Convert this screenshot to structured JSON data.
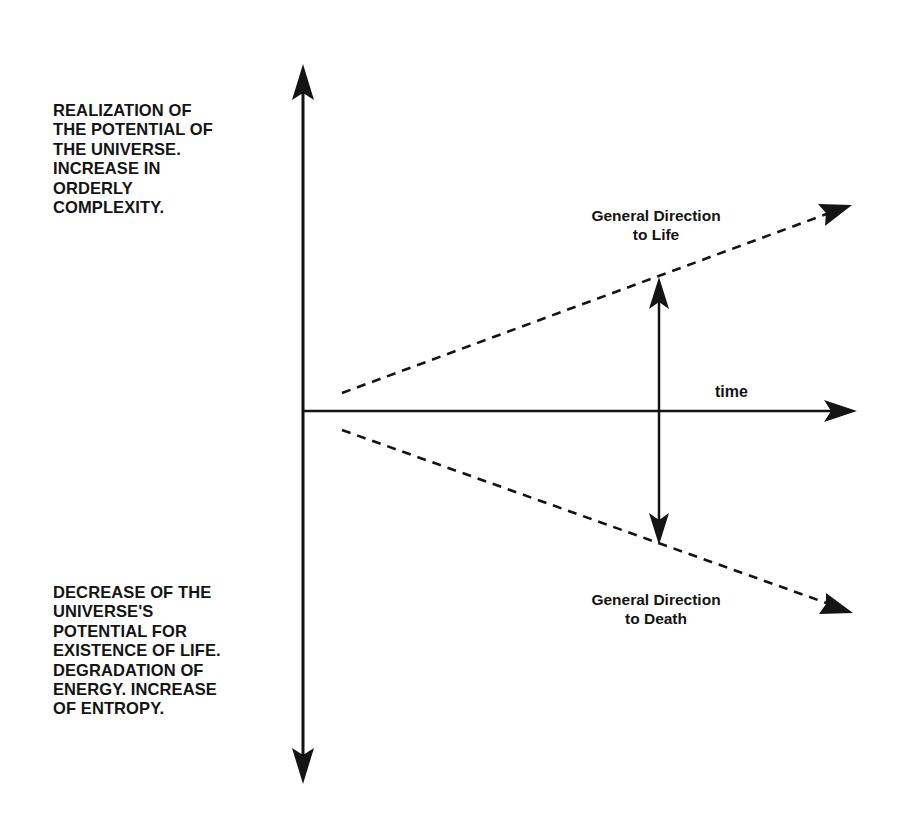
{
  "diagram": {
    "type": "axes-with-directional-trends",
    "colors": {
      "ink": "#141414",
      "background": "#ffffff"
    },
    "vertical_axis": {
      "top_caption_lines": [
        "REALIZATION OF",
        "THE POTENTIAL OF",
        "THE UNIVERSE.",
        "INCREASE IN",
        "ORDERLY",
        "COMPLEXITY."
      ],
      "bottom_caption_lines": [
        "DECREASE OF THE",
        "UNIVERSE'S",
        "POTENTIAL FOR",
        "EXISTENCE OF LIFE.",
        "DEGRADATION OF",
        "ENERGY. INCREASE",
        "OF ENTROPY."
      ]
    },
    "horizontal_axis": {
      "label": "time"
    },
    "trends": {
      "upper": {
        "label_lines": [
          "General Direction",
          "to Life"
        ],
        "style": "dashed"
      },
      "lower": {
        "label_lines": [
          "General Direction",
          "to Death"
        ],
        "style": "dashed"
      }
    },
    "divergence_arrow": {
      "style": "double-headed"
    }
  }
}
